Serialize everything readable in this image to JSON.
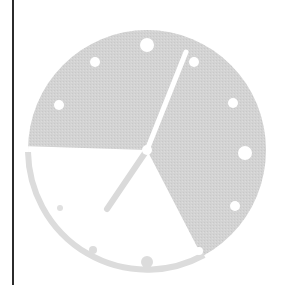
{
  "figure": {
    "title": "Clock illustration",
    "description": "Stylized analog clock with a shaded elapsed-time wedge"
  },
  "clock": {
    "center": [
      147,
      150
    ],
    "radius_x": 119,
    "radius_y": 120,
    "face_color": "#d3d3d3",
    "wedge_color": "#ffffff",
    "wedge": {
      "start_angle_deg": 180,
      "end_angle_deg": 58,
      "direction": "counterclockwise-downward"
    },
    "hands": {
      "minute": {
        "end": [
          186,
          52
        ],
        "color": "#ffffff",
        "width": 5
      },
      "hour": {
        "end": [
          107,
          209
        ],
        "color": "#dadada",
        "width": 6
      }
    },
    "markers": [
      {
        "hour": 12,
        "x": 147,
        "y": 45,
        "r": 7,
        "color": "#ffffff"
      },
      {
        "hour": 1,
        "x": 194,
        "y": 62,
        "r": 5,
        "color": "#ffffff"
      },
      {
        "hour": 2,
        "x": 233,
        "y": 103,
        "r": 5,
        "color": "#ffffff"
      },
      {
        "hour": 3,
        "x": 245,
        "y": 153,
        "r": 7,
        "color": "#ffffff"
      },
      {
        "hour": 4,
        "x": 235,
        "y": 206,
        "r": 5,
        "color": "#ffffff"
      },
      {
        "hour": 5,
        "x": 199,
        "y": 251,
        "r": 4,
        "color": "#ffffff"
      },
      {
        "hour": 6,
        "x": 147,
        "y": 262,
        "r": 6,
        "color": "#dcdcdc"
      },
      {
        "hour": 7,
        "x": 93,
        "y": 250,
        "r": 4,
        "color": "#dcdcdc"
      },
      {
        "hour": 8,
        "x": 60,
        "y": 208,
        "r": 3,
        "color": "#e0e0e0"
      },
      {
        "hour": 9,
        "x": 51,
        "y": 155,
        "r": 6,
        "color": "#ffffff"
      },
      {
        "hour": 10,
        "x": 59,
        "y": 105,
        "r": 5,
        "color": "#ffffff"
      },
      {
        "hour": 11,
        "x": 95,
        "y": 62,
        "r": 5,
        "color": "#ffffff"
      }
    ]
  },
  "divider": {
    "color": "#2b2b2b"
  }
}
